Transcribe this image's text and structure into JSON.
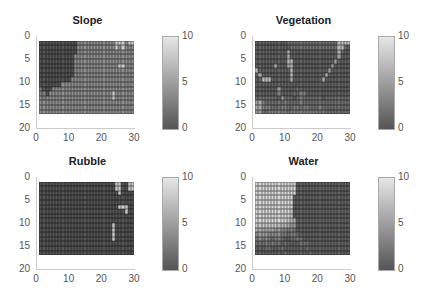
{
  "chart_data": [
    {
      "type": "heatmap",
      "title": "Slope",
      "xlim": [
        0,
        30
      ],
      "ylim": [
        0,
        20
      ],
      "yreversed": true,
      "xticks": [
        "0",
        "10",
        "20",
        "30"
      ],
      "yticks": [
        "0",
        "5",
        "10",
        "15",
        "20"
      ],
      "colorbar": {
        "min": 0,
        "max": 10,
        "ticks": [
          "0",
          "5",
          "10"
        ],
        "colormap": "gray"
      },
      "grid_extent": {
        "cols": 30,
        "rows": 16,
        "x": [
          1,
          30
        ],
        "y": [
          1,
          17
        ]
      },
      "rows": [
        "000000000000444444444444888488",
        "000000000000444444444444848444",
        "000000000000444444444444444444",
        "000000000004444444444444444444",
        "000000000004444444444444444444",
        "000000000004444444444444488444",
        "000000000004444444444444444444",
        "000000000004444444444444444444",
        "000000000044444444444444444444",
        "000000044444444444444444444444",
        "300044444444444444444444444444",
        "330444444444444444444448444444",
        "434444444444444444444448444444",
        "444444444444444444444444444444",
        "444444444444444444444444444444",
        "444444444444444444444444444444"
      ]
    },
    {
      "type": "heatmap",
      "title": "Vegetation",
      "xlim": [
        0,
        30
      ],
      "ylim": [
        0,
        20
      ],
      "yreversed": true,
      "xticks": [
        "0",
        "10",
        "20",
        "30"
      ],
      "yticks": [
        "0",
        "5",
        "10",
        "15",
        "20"
      ],
      "colorbar": {
        "min": 0,
        "max": 10,
        "ticks": [
          "0",
          "5",
          "10"
        ],
        "colormap": "gray"
      },
      "grid_extent": {
        "cols": 30,
        "rows": 16,
        "x": [
          1,
          30
        ],
        "y": [
          1,
          17
        ]
      },
      "rows": [
        "111111111122222222222222227777",
        "111111111112222222222222227721",
        "111111111161111111111111116211",
        "111111111161111111111111115111",
        "111111111177111111111111151111",
        "111111611167111111111111511111",
        "711111111117111111111115111111",
        "161111111117111111111161111111",
        "117771111116111111111611111111",
        "111111111111111111111111111111",
        "111111151111121111111111111111",
        "111111131111213311111111111111",
        "222222215222123222222122222222",
        "563222222322223222222222222222",
        "663332223322332332223222222222",
        "552233333323333333332322222222"
      ]
    },
    {
      "type": "heatmap",
      "title": "Rubble",
      "xlim": [
        0,
        30
      ],
      "ylim": [
        0,
        20
      ],
      "yreversed": true,
      "xticks": [
        "0",
        "10",
        "20",
        "30"
      ],
      "yticks": [
        "0",
        "5",
        "10",
        "15",
        "20"
      ],
      "colorbar": {
        "min": 0,
        "max": 10,
        "ticks": [
          "0",
          "5",
          "10"
        ],
        "colormap": "gray"
      },
      "grid_extent": {
        "cols": 30,
        "rows": 16,
        "x": [
          1,
          30
        ],
        "y": [
          1,
          17
        ]
      },
      "rows": [
        "000000000000000000000000880088",
        "000000000000000000000000880088",
        "000000000000000000000000080000",
        "000000000000000000000000000000",
        "000000000000000000000000000000",
        "000000000000000000000000088800",
        "000000000000000000000000000800",
        "000000000000000000000000000000",
        "000000000000000000000000000000",
        "000000000000000000000008000000",
        "000000000000000000000008000000",
        "000000000000000000000008000000",
        "000000000000000000000008000000",
        "000000000000000000000000000000",
        "000000000000000000000000000000",
        "000000000000000000000000000000"
      ]
    },
    {
      "type": "heatmap",
      "title": "Water",
      "xlim": [
        0,
        30
      ],
      "ylim": [
        0,
        20
      ],
      "yreversed": true,
      "xticks": [
        "0",
        "10",
        "20",
        "30"
      ],
      "yticks": [
        "0",
        "5",
        "10",
        "15",
        "20"
      ],
      "colorbar": {
        "min": 0,
        "max": 10,
        "ticks": [
          "0",
          "5",
          "10"
        ],
        "colormap": "gray"
      },
      "grid_extent": {
        "cols": 30,
        "rows": 16,
        "x": [
          1,
          30
        ],
        "y": [
          1,
          17
        ]
      },
      "rows": [
        "999999999999911111111111111111",
        "999999999999911111111111111111",
        "999999999999911111111111111111",
        "999999999999111111111111111111",
        "999999999999111111111111111111",
        "999999999999111111111111111111",
        "999999999998111111111111111111",
        "999999999998111111111111111111",
        "999999999987611111111111111111",
        "888888877765511111111111111111",
        "766666554434311111111111111111",
        "455544443323321111111111111111",
        "343432332112232111111111111111",
        "222323221211112221111111111111",
        "111221112111111121111111111111",
        "111111111211111112111111111111"
      ]
    }
  ]
}
